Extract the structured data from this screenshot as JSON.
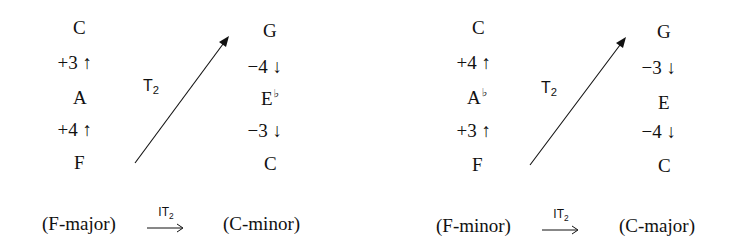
{
  "panels": [
    {
      "source": {
        "top": "C",
        "int_upper": "+3",
        "int_upper_dir": "↑",
        "mid": "A",
        "mid_accidental": "",
        "int_lower": "+4",
        "int_lower_dir": "↑",
        "bottom": "F"
      },
      "target": {
        "top": "G",
        "int_upper": "−4",
        "int_upper_dir": "↓",
        "mid": "E",
        "mid_accidental": "♭",
        "int_lower": "−3",
        "int_lower_dir": "↓",
        "bottom": "C"
      },
      "transform": {
        "base": "T",
        "sub": "2"
      },
      "caption": {
        "from": "(F-major)",
        "op_base": "IT",
        "op_sub": "2",
        "to": "(C-minor)"
      }
    },
    {
      "source": {
        "top": "C",
        "int_upper": "+4",
        "int_upper_dir": "↑",
        "mid": "A",
        "mid_accidental": "♭",
        "int_lower": "+3",
        "int_lower_dir": "↑",
        "bottom": "F"
      },
      "target": {
        "top": "G",
        "int_upper": "−3",
        "int_upper_dir": "↓",
        "mid": "E",
        "mid_accidental": "",
        "int_lower": "−4",
        "int_lower_dir": "↓",
        "bottom": "C"
      },
      "transform": {
        "base": "T",
        "sub": "2"
      },
      "caption": {
        "from": "(F-minor)",
        "op_base": "IT",
        "op_sub": "2",
        "to": "(C-major)"
      }
    }
  ]
}
